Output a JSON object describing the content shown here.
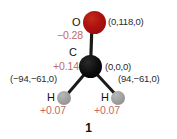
{
  "figure": {
    "caption": "1",
    "background_color": "#ffffff",
    "charge_text_color": "#c16a6a",
    "coord_text_color": "#2b2b2b"
  },
  "atoms": [
    {
      "element": "O",
      "color": "#ae1210",
      "charge": "−0.28",
      "coordinates": "(0,118,0)"
    },
    {
      "element": "C",
      "color": "#000000",
      "charge": "+0.14",
      "coordinates": "(0,0,0)"
    },
    {
      "element": "H",
      "color": "#9d9d9d",
      "charge": "+0.07",
      "coordinates": "(−94,−61,0)"
    },
    {
      "element": "H",
      "color": "#9d9d9d",
      "charge": "+0.07",
      "coordinates": "(94,−61,0)"
    }
  ],
  "bonds": {
    "color": "#1a1a1a",
    "pairs": [
      "O=C",
      "C-H(left)",
      "C-H(right)"
    ]
  }
}
